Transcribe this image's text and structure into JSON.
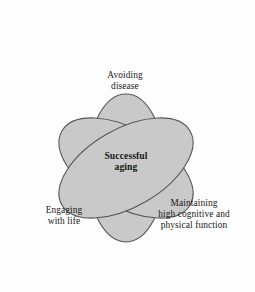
{
  "diagram": {
    "type": "venn-trefoil",
    "background_color": "#fefefe",
    "lobe_fill_color": "#c9c9c9",
    "lobe_stroke_color": "#555555",
    "text_color": "#1a1a1a",
    "center_label": {
      "text": "Successful\naging",
      "emphasis": "bold"
    },
    "lobes": [
      {
        "id": "avoiding-disease",
        "label": "Avoiding\ndisease",
        "position": "top"
      },
      {
        "id": "engaging-with-life",
        "label": "Engaging\nwith life",
        "position": "bottom-left"
      },
      {
        "id": "maintaining-function",
        "label": "Maintaining\nhigh cognitive and\nphysical function",
        "position": "bottom-right"
      }
    ]
  }
}
